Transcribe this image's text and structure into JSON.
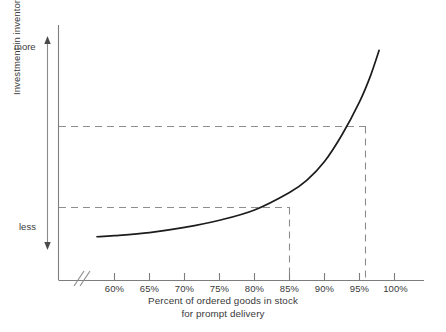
{
  "chart_data": {
    "type": "line",
    "title": "",
    "subtitle": "",
    "xlabel_line1": "Percent of ordered goods in stock",
    "xlabel_line2": "for prompt delivery",
    "ylabel": "Investment in inventory",
    "y_top_label": "more",
    "y_bottom_label": "less",
    "x_tick_labels": [
      "60%",
      "65%",
      "70%",
      "75%",
      "80%",
      "85%",
      "90%",
      "95%",
      "100%"
    ],
    "x_tick_values": [
      60,
      65,
      70,
      75,
      80,
      85,
      90,
      95,
      100
    ],
    "y_tick_labels": [],
    "xlim": [
      57,
      101
    ],
    "ylim": [
      0,
      1
    ],
    "grid": false,
    "legend": false,
    "axis_break": true,
    "axis_break_note": "double-slash break on x-axis between origin and 60%",
    "series": [
      {
        "name": "Investment in inventory",
        "x": [
          57.5,
          60,
          65,
          70,
          75,
          80,
          85,
          87.5,
          90,
          92.5,
          95,
          96.5,
          97.8
        ],
        "y": [
          0.045,
          0.05,
          0.065,
          0.09,
          0.125,
          0.175,
          0.26,
          0.32,
          0.41,
          0.54,
          0.7,
          0.82,
          0.95
        ]
      }
    ],
    "annotations": [
      {
        "name": "reference-85",
        "x": 85,
        "y": 0.26,
        "type": "dashed-crosshair",
        "label": "85%"
      },
      {
        "name": "reference-95",
        "x": 95,
        "y": 0.7,
        "type": "dashed-crosshair",
        "label": "95%"
      }
    ],
    "colors": {
      "curve": "#1a1a1a",
      "axis": "#6e6e6e",
      "dashed": "#8a8a8a",
      "text": "#3a3a3a",
      "background": "#ffffff"
    }
  }
}
